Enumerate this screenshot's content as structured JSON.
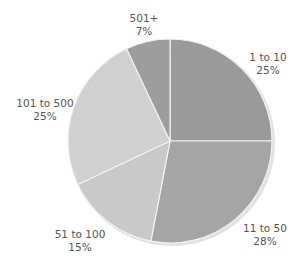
{
  "chart_data": {
    "type": "pie",
    "title": "",
    "start_angle_deg": 0,
    "direction": "clockwise",
    "categories": [
      "1 to 10",
      "11 to 50",
      "51 to 100",
      "101 to 500",
      "501+"
    ],
    "values": [
      25,
      28,
      15,
      25,
      7
    ],
    "units": "%",
    "colors": [
      "#9a9a9a",
      "#a5a5a5",
      "#c9c9c9",
      "#d0d0d0",
      "#9d9d9d"
    ],
    "legend": "none (labels placed outside slices)",
    "labels": [
      {
        "name": "1 to 10",
        "pct": "25%",
        "x": 268,
        "y": 51
      },
      {
        "name": "11 to 50",
        "pct": "28%",
        "x": 265,
        "y": 222
      },
      {
        "name": "51 to 100",
        "pct": "15%",
        "x": 80,
        "y": 228
      },
      {
        "name": "101 to 500",
        "pct": "25%",
        "x": 45,
        "y": 97
      },
      {
        "name": "501+",
        "pct": "7%",
        "x": 144,
        "y": 12
      }
    ]
  },
  "geometry": {
    "cx": 170,
    "cy": 141,
    "r": 102,
    "separator_color": "#f2f2f2",
    "shadow_color": "#e2e2e2"
  }
}
